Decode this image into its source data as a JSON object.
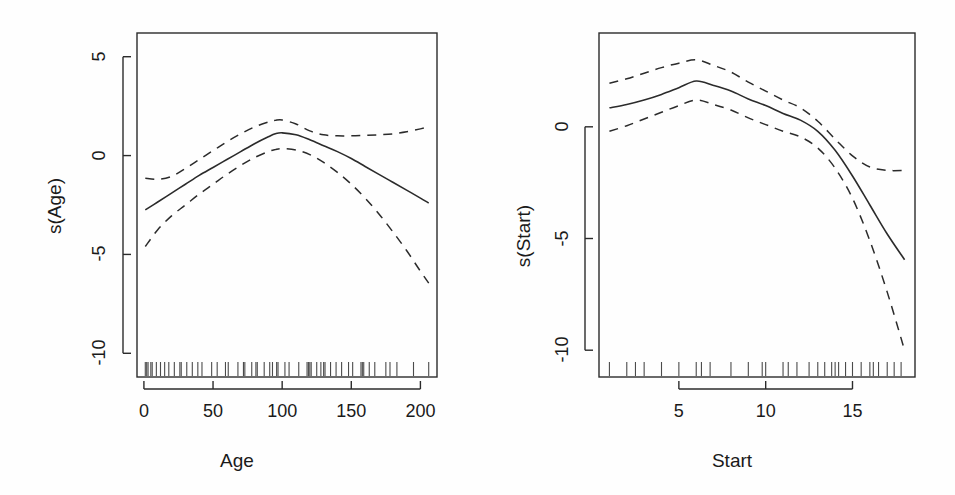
{
  "figure": {
    "background_color": "#fefefe",
    "line_color": "#2b2b2b",
    "width": 955,
    "height": 495
  },
  "chart_data": [
    {
      "type": "line",
      "panel_id": "age",
      "title": "",
      "xlabel": "Age",
      "ylabel": "s(Age)",
      "xlim": [
        -5,
        212
      ],
      "ylim": [
        -11.2,
        6.2
      ],
      "xticks": [
        0,
        50,
        100,
        150,
        200
      ],
      "xtick_labels": [
        "0",
        "50",
        "100",
        "150",
        "200"
      ],
      "yticks": [
        5,
        0,
        -5,
        -10
      ],
      "ytick_labels": [
        "5",
        "0",
        "-5",
        "-10"
      ],
      "grid": false,
      "legend": "none",
      "series": [
        {
          "name": "fit",
          "style": "solid",
          "x": [
            1,
            10,
            20,
            30,
            40,
            50,
            60,
            70,
            80,
            90,
            95,
            100,
            110,
            120,
            130,
            140,
            150,
            160,
            170,
            180,
            190,
            200,
            206
          ],
          "values": [
            -2.75,
            -2.35,
            -1.9,
            -1.45,
            -1.0,
            -0.6,
            -0.2,
            0.2,
            0.6,
            0.95,
            1.1,
            1.15,
            1.05,
            0.8,
            0.5,
            0.2,
            -0.15,
            -0.55,
            -0.95,
            -1.35,
            -1.75,
            -2.15,
            -2.4
          ]
        },
        {
          "name": "upper-ci",
          "style": "dashed",
          "x": [
            1,
            10,
            20,
            30,
            40,
            50,
            60,
            70,
            80,
            90,
            95,
            100,
            110,
            120,
            130,
            140,
            150,
            160,
            170,
            180,
            190,
            200,
            206
          ],
          "values": [
            -1.15,
            -1.2,
            -1.05,
            -0.65,
            -0.2,
            0.25,
            0.7,
            1.1,
            1.45,
            1.7,
            1.78,
            1.8,
            1.6,
            1.25,
            1.05,
            1.0,
            1.0,
            1.02,
            1.05,
            1.1,
            1.2,
            1.35,
            1.45
          ]
        },
        {
          "name": "lower-ci",
          "style": "dashed",
          "x": [
            1,
            10,
            20,
            30,
            40,
            50,
            60,
            70,
            80,
            90,
            95,
            100,
            110,
            120,
            130,
            140,
            150,
            160,
            170,
            180,
            190,
            200,
            206
          ],
          "values": [
            -4.6,
            -3.75,
            -3.05,
            -2.5,
            -1.95,
            -1.45,
            -0.95,
            -0.5,
            -0.1,
            0.2,
            0.3,
            0.35,
            0.28,
            0.05,
            -0.35,
            -0.85,
            -1.45,
            -2.15,
            -2.95,
            -3.85,
            -4.8,
            -5.85,
            -6.45
          ]
        }
      ],
      "rug_values": [
        1,
        2,
        3,
        5,
        6,
        9,
        12,
        15,
        18,
        22,
        26,
        27,
        31,
        35,
        39,
        42,
        49,
        53,
        59,
        61,
        68,
        72,
        73,
        78,
        81,
        82,
        87,
        91,
        93,
        96,
        97,
        102,
        105,
        112,
        118,
        119,
        120,
        121,
        125,
        128,
        130,
        131,
        135,
        139,
        143,
        148,
        151,
        157,
        158,
        159,
        163,
        167,
        175,
        178,
        183,
        195,
        206
      ],
      "rug_position": "bottom",
      "annotations": []
    },
    {
      "type": "line",
      "panel_id": "start",
      "title": "",
      "xlabel": "Start",
      "ylabel": "s(Start)",
      "xlim": [
        0.4,
        18.6
      ],
      "ylim": [
        -11.2,
        4.2
      ],
      "xticks": [
        5,
        10,
        15
      ],
      "xtick_labels": [
        "5",
        "10",
        "15"
      ],
      "yticks": [
        0,
        -5,
        -10
      ],
      "ytick_labels": [
        "0",
        "-5",
        "-10"
      ],
      "grid": false,
      "legend": "none",
      "series": [
        {
          "name": "fit",
          "style": "solid",
          "x": [
            1,
            2,
            3,
            4,
            5,
            6,
            7,
            8,
            9,
            10,
            11,
            12,
            13,
            14,
            15,
            16,
            17,
            18
          ],
          "values": [
            0.85,
            1.0,
            1.2,
            1.45,
            1.75,
            2.05,
            1.85,
            1.6,
            1.25,
            0.95,
            0.6,
            0.3,
            -0.2,
            -1.05,
            -2.2,
            -3.5,
            -4.8,
            -5.95
          ]
        },
        {
          "name": "upper-ci",
          "style": "dashed",
          "x": [
            1,
            2,
            3,
            4,
            5,
            6,
            7,
            8,
            9,
            10,
            11,
            12,
            13,
            14,
            15,
            16,
            17,
            18
          ],
          "values": [
            1.95,
            2.15,
            2.4,
            2.65,
            2.85,
            3.0,
            2.75,
            2.45,
            2.0,
            1.6,
            1.2,
            0.85,
            0.25,
            -0.55,
            -1.3,
            -1.8,
            -1.95,
            -1.95
          ]
        },
        {
          "name": "lower-ci",
          "style": "dashed",
          "x": [
            1,
            2,
            3,
            4,
            5,
            6,
            7,
            8,
            9,
            10,
            11,
            12,
            13,
            14,
            15,
            16,
            17,
            18
          ],
          "values": [
            -0.2,
            0.05,
            0.35,
            0.65,
            0.95,
            1.2,
            1.0,
            0.75,
            0.4,
            0.1,
            -0.2,
            -0.45,
            -0.95,
            -1.85,
            -3.2,
            -5.1,
            -7.4,
            -10.0
          ]
        }
      ],
      "rug_values": [
        1,
        2,
        2.5,
        3,
        4,
        5,
        6,
        6.3,
        6.8,
        8,
        9,
        9.8,
        10,
        11,
        11.3,
        11.8,
        12.5,
        13,
        13.4,
        13.8,
        14,
        14.2,
        14.6,
        15,
        15.5,
        16,
        16.2,
        16.5,
        17,
        17.4,
        17.8
      ],
      "rug_position": "bottom",
      "annotations": []
    }
  ]
}
